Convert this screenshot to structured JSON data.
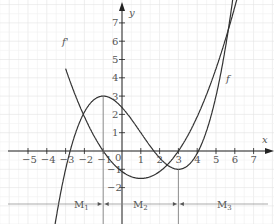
{
  "chart_data": {
    "type": "line",
    "title": "",
    "xlabel": "x",
    "ylabel": "y",
    "xlim": [
      -6,
      7.8
    ],
    "ylim": [
      -4,
      8
    ],
    "grid": true,
    "x_ticks": [
      "-5",
      "-4",
      "-3",
      "-2",
      "-1",
      "0",
      "1",
      "2",
      "3",
      "4",
      "5",
      "6",
      "7"
    ],
    "y_ticks": [
      "-2",
      "-1",
      "1",
      "2",
      "3",
      "4",
      "5",
      "6",
      "7"
    ],
    "series": [
      {
        "name": "f",
        "description": "cubic, local max (-1,3), local min (3,-1)",
        "points": [
          [
            -3.5,
            -4
          ],
          [
            -2,
            1.6
          ],
          [
            -1,
            3
          ],
          [
            0,
            2.4
          ],
          [
            1,
            0.9
          ],
          [
            2,
            -0.3
          ],
          [
            3,
            -1
          ],
          [
            4,
            -0.5
          ],
          [
            5,
            1.6
          ],
          [
            5.8,
            7.5
          ]
        ]
      },
      {
        "name": "f'",
        "description": "parabola, zeros at -1 and 3, vertex (1,-1.5)",
        "points": [
          [
            -2,
            7.8
          ],
          [
            -1,
            0
          ],
          [
            0,
            -1.1
          ],
          [
            1,
            -1.5
          ],
          [
            2,
            -1.1
          ],
          [
            3,
            0
          ],
          [
            4,
            1.9
          ],
          [
            5,
            4.5
          ],
          [
            5.7,
            7.5
          ]
        ]
      }
    ],
    "annotations": [
      {
        "text": "M1",
        "interval": "x < -1"
      },
      {
        "text": "M2",
        "interval": "-1 < x < 3"
      },
      {
        "text": "M3",
        "interval": "x > 3"
      }
    ]
  },
  "labels": {
    "x_axis": "x",
    "y_axis": "y",
    "f": "f",
    "fprime": "f'",
    "origin": "0",
    "m1": "M",
    "m2": "M",
    "m3": "M",
    "sub1": "1",
    "sub2": "2",
    "sub3": "3"
  }
}
